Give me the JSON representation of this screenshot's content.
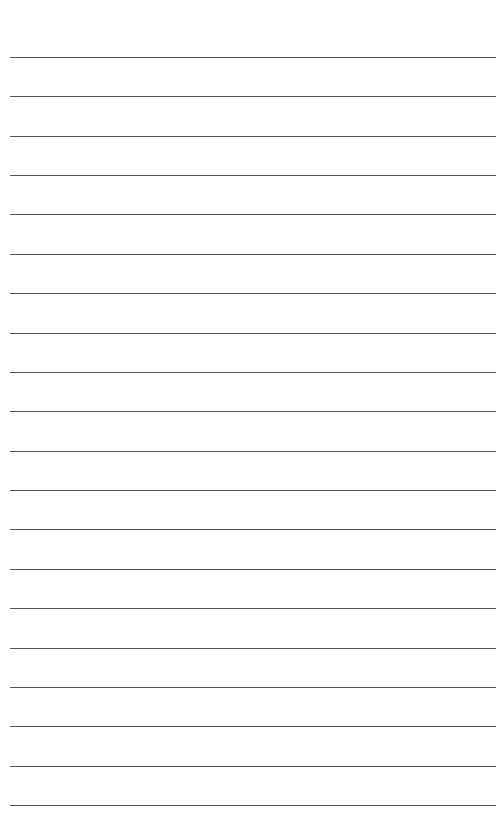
{
  "document": {
    "type": "lined-paper",
    "line_count": 20,
    "line_color": "#555555",
    "background": "#ffffff",
    "first_line_y": 57,
    "line_spacing": 39.37
  }
}
